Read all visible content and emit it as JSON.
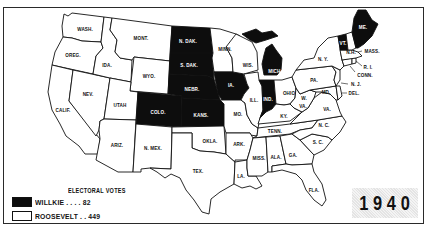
{
  "map": {
    "year": "1940",
    "legend": {
      "title": "ELECTORAL VOTES",
      "items": [
        {
          "candidate": "WILLKIE",
          "label": "WILLKIE . . . .  82",
          "votes": 82,
          "color": "#0d0d0d"
        },
        {
          "candidate": "ROOSEVELT",
          "label": "ROOSEVELT . . 449",
          "votes": 449,
          "color": "#ffffff"
        }
      ]
    },
    "states": {
      "wash": "WASH.",
      "oreg": "OREG.",
      "calif": "CALIF.",
      "ida": "IDA.",
      "nev": "NEV.",
      "mont": "MONT.",
      "wyo": "WYO.",
      "utah": "UTAH",
      "ariz": "ARIZ.",
      "colo": "COLO.",
      "nmex": "N. MEX.",
      "ndak": "N. DAK.",
      "sdak": "S. DAK.",
      "nebr": "NEBR.",
      "kans": "KANS.",
      "okla": "OKLA.",
      "tex": "TEX.",
      "minn": "MINN.",
      "ia": "IA.",
      "mo": "MO.",
      "ark": "ARK.",
      "la": "LA.",
      "wis": "WIS.",
      "ill": "ILL.",
      "mich": "MICH.",
      "ind": "IND.",
      "ohio": "OHIO",
      "ky": "KY.",
      "tenn": "TENN.",
      "miss": "MISS.",
      "ala": "ALA.",
      "ga": "GA.",
      "fla": "FLA.",
      "sc": "S. C.",
      "nc": "N. C.",
      "va": "VA.",
      "wva_w": "W.",
      "wva_va": "VA.",
      "md": "MD.",
      "del": "DEL.",
      "pa": "PA.",
      "nj": "N. J.",
      "ny": "N. Y.",
      "conn": "CONN.",
      "ri": "R. I.",
      "mass": "MASS.",
      "vt": "VT.",
      "nh": "N.H.",
      "me": "ME."
    },
    "willkie_states": [
      "ME.",
      "VT.",
      "MICH.",
      "IND.",
      "IA.",
      "N. DAK.",
      "S. DAK.",
      "NEBR.",
      "KANS.",
      "COLO."
    ]
  }
}
